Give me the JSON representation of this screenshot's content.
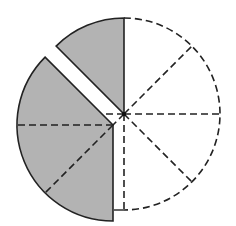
{
  "diagram": {
    "type": "fraction-circle",
    "total_sectors": 8,
    "shaded_sectors": 4,
    "detached_sectors": 3,
    "colors": {
      "shade": "#b3b3b3",
      "stroke": "#222222",
      "background": "#ffffff"
    },
    "main_circle": {
      "cx": 124,
      "cy": 114,
      "r": 96
    },
    "detached_piece": {
      "cx": 113,
      "cy": 125,
      "r": 96
    }
  }
}
